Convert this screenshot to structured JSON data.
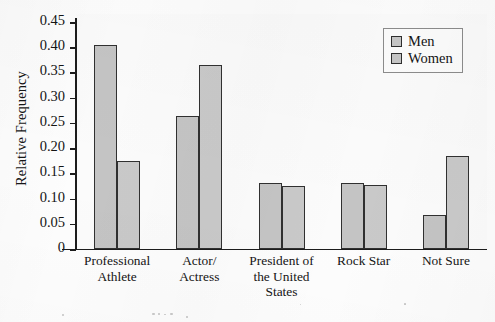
{
  "chart_data": {
    "type": "bar",
    "title": "",
    "xlabel": "",
    "ylabel": "Relative Frequency",
    "ylim": [
      0,
      0.45
    ],
    "yticks": [
      "0",
      "0.05",
      "0.10",
      "0.15",
      "0.20",
      "0.25",
      "0.30",
      "0.35",
      "0.40",
      "0.45"
    ],
    "ytick_values": [
      0,
      0.05,
      0.1,
      0.15,
      0.2,
      0.25,
      0.3,
      0.35,
      0.4,
      0.45
    ],
    "grid": false,
    "legend_position": "top-right",
    "categories": [
      "Professional\nAthlete",
      "Actor/\nActress",
      "President of\nthe United\nStates",
      "Rock Star",
      "Not Sure"
    ],
    "series": [
      {
        "name": "Men",
        "values": [
          0.405,
          0.263,
          0.13,
          0.13,
          0.068
        ]
      },
      {
        "name": "Women",
        "values": [
          0.175,
          0.365,
          0.125,
          0.127,
          0.185
        ]
      }
    ]
  },
  "axes": {
    "y_title": "Relative Frequency",
    "tick_labels": [
      "0.45",
      "0.40",
      "0.35",
      "0.30",
      "0.25",
      "0.20",
      "0.15",
      "0.10",
      "0.05",
      "0"
    ]
  },
  "legend": {
    "items": [
      {
        "label": "Men",
        "color": "#c4c4c4"
      },
      {
        "label": "Women",
        "color": "#c9c9c9"
      }
    ]
  },
  "categories": [
    {
      "lines": [
        "Professional",
        "Athlete"
      ]
    },
    {
      "lines": [
        "Actor/",
        "Actress"
      ]
    },
    {
      "lines": [
        "President of",
        "the United",
        "States"
      ]
    },
    {
      "lines": [
        "Rock Star"
      ]
    },
    {
      "lines": [
        "Not Sure"
      ]
    }
  ],
  "colors": {
    "bar_men": "#c4c4c4",
    "bar_women": "#c9c9c9",
    "bar_outline": "#303030",
    "axis": "#1c1c1c",
    "text": "#141414",
    "background": "#fdfdfd"
  }
}
